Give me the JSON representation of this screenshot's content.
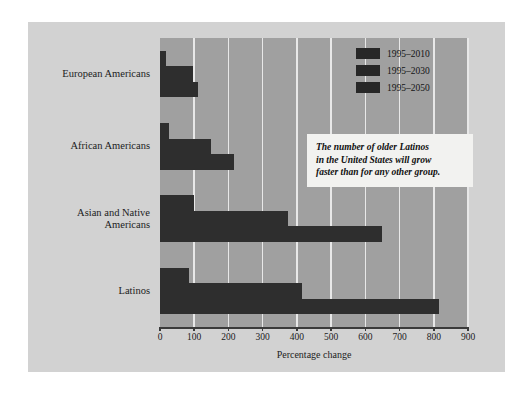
{
  "chart_data": {
    "type": "bar",
    "orientation": "horizontal",
    "title": "",
    "xlabel": "Percentage change",
    "ylabel": "",
    "xlim": [
      0,
      900
    ],
    "xticks": [
      0,
      100,
      200,
      300,
      400,
      500,
      600,
      700,
      800,
      900
    ],
    "xtick_labels": [
      "0",
      "100",
      "200",
      "300",
      "400",
      "500",
      "600",
      "700",
      "800",
      "900"
    ],
    "grid": "vertical",
    "categories": [
      "European Americans",
      "African Americans",
      "Asian and Native\nAmericans",
      "Latinos"
    ],
    "series": [
      {
        "name": "1995–2010",
        "values": [
          18,
          25,
          100,
          85
        ]
      },
      {
        "name": "1995–2030",
        "values": [
          95,
          150,
          375,
          415
        ]
      },
      {
        "name": "1995–2050",
        "values": [
          110,
          215,
          650,
          815
        ]
      }
    ],
    "legend_position": "top-right",
    "bar_color": "#2e2e2e",
    "plot_background": "#a0a0a0",
    "figure_background": "#d2d2d2",
    "gridline_color": "#e8e8e8"
  },
  "legend": {
    "entries": [
      {
        "label": "1995–2010",
        "color": "#272727"
      },
      {
        "label": "1995–2030",
        "color": "#272727"
      },
      {
        "label": "1995–2050",
        "color": "#272727"
      }
    ]
  },
  "callout": {
    "text": "The number of older Latinos\nin the United States will grow\nfaster than for any other group."
  },
  "axis": {
    "x_title": "Percentage change"
  }
}
